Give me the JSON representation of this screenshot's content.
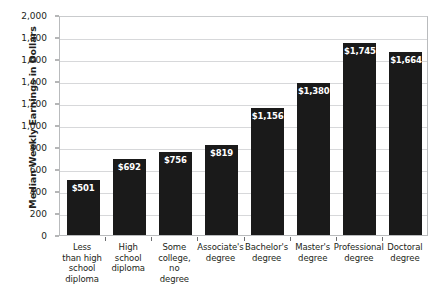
{
  "chart_data": {
    "type": "bar",
    "title": "",
    "subtitle": "",
    "xlabel": "",
    "ylabel": "Median Weekly Earnings in Dollars",
    "ylim": [
      0,
      2000
    ],
    "ytick_step": 200,
    "grid": true,
    "legend": "none",
    "bar_color": "#1a1a1a",
    "gridline_color": "#d7d8da",
    "label_color": "#ffffff",
    "categories": [
      "Less than high school diploma",
      "High school diploma",
      "Some college, no degree",
      "Associate's degree",
      "Bachelor's degree",
      "Master's degree",
      "Professional degree",
      "Doctoral degree"
    ],
    "category_lines": [
      [
        "Less",
        "than high",
        "school",
        "diploma"
      ],
      [
        "High",
        "school",
        "diploma"
      ],
      [
        "Some",
        "college,",
        "no",
        "degree"
      ],
      [
        "Associate's",
        "degree"
      ],
      [
        "Bachelor's",
        "degree"
      ],
      [
        "Master's",
        "degree"
      ],
      [
        "Professional",
        "degree"
      ],
      [
        "Doctoral",
        "degree"
      ]
    ],
    "values": [
      501,
      692,
      756,
      819,
      1156,
      1380,
      1745,
      1664
    ],
    "value_labels": [
      "$501",
      "$692",
      "$756",
      "$819",
      "$1,156",
      "$1,380",
      "$1,745",
      "$1,664"
    ],
    "ytick_labels": [
      "2,000",
      "1,800",
      "1,600",
      "1,400",
      "1,200",
      "1,000",
      "800",
      "600",
      "400",
      "200",
      "0"
    ],
    "ytick_values": [
      2000,
      1800,
      1600,
      1400,
      1200,
      1000,
      800,
      600,
      400,
      200,
      0
    ]
  }
}
